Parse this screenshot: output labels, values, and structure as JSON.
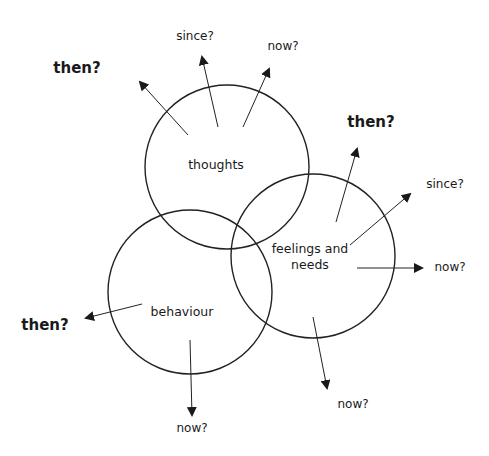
{
  "diagram": {
    "type": "venn-with-time-arrows",
    "circles": [
      {
        "id": "thoughts",
        "label": "thoughts",
        "cx": 227,
        "cy": 167,
        "r": 82,
        "label_x": 216,
        "label_y": 165
      },
      {
        "id": "feelings",
        "label_line1": "feelings and",
        "label_line2": "needs",
        "cx": 313,
        "cy": 256,
        "r": 82,
        "label_x": 310,
        "label_y": 257
      },
      {
        "id": "behaviour",
        "label": "behaviour",
        "cx": 190,
        "cy": 292,
        "r": 82,
        "label_x": 182,
        "label_y": 312
      }
    ],
    "arrows": [
      {
        "from": "thoughts",
        "x1": 188,
        "y1": 135,
        "x2": 140,
        "y2": 82,
        "label": "then?",
        "style": "big",
        "lx": 77,
        "ly": 68
      },
      {
        "from": "thoughts",
        "x1": 218,
        "y1": 127,
        "x2": 202,
        "y2": 57,
        "label": "since?",
        "style": "small",
        "lx": 195,
        "ly": 36
      },
      {
        "from": "thoughts",
        "x1": 243,
        "y1": 127,
        "x2": 269,
        "y2": 69,
        "label": "now?",
        "style": "small",
        "lx": 283,
        "ly": 46
      },
      {
        "from": "feelings",
        "x1": 336,
        "y1": 222,
        "x2": 357,
        "y2": 149,
        "label": "then?",
        "style": "big",
        "lx": 371,
        "ly": 122
      },
      {
        "from": "feelings",
        "x1": 350,
        "y1": 245,
        "x2": 410,
        "y2": 194,
        "label": "since?",
        "style": "small",
        "lx": 445,
        "ly": 184
      },
      {
        "from": "feelings",
        "x1": 357,
        "y1": 268,
        "x2": 422,
        "y2": 268,
        "label": "now?",
        "style": "small",
        "lx": 450,
        "ly": 267
      },
      {
        "from": "feelings",
        "x1": 313,
        "y1": 317,
        "x2": 327,
        "y2": 388,
        "label": "now?",
        "style": "small",
        "lx": 353,
        "ly": 404
      },
      {
        "from": "behaviour",
        "x1": 142,
        "y1": 304,
        "x2": 86,
        "y2": 318,
        "label": "then?",
        "style": "big",
        "lx": 45,
        "ly": 325
      },
      {
        "from": "behaviour",
        "x1": 190,
        "y1": 340,
        "x2": 192,
        "y2": 415,
        "label": "now?",
        "style": "small",
        "lx": 192,
        "ly": 428
      }
    ],
    "colors": {
      "stroke": "#222222",
      "text": "#1a1a1a",
      "background": "#ffffff"
    }
  }
}
